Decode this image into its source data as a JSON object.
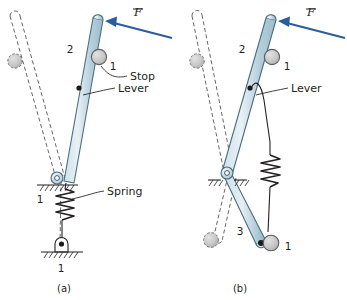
{
  "figure": {
    "type": "mechanism-kinematic-diagram",
    "colors": {
      "link_fill": "#b9d1de",
      "link_fill_light": "#d7e6ee",
      "link_stroke": "#4c6d7d",
      "force_arrow": "#2c5d9b",
      "stop_fill": "#c9c9c9",
      "stop_stroke": "#6b6b6b",
      "line": "#231f20",
      "ghost_dash": "#555555",
      "background": "#ffffff"
    },
    "panels": [
      {
        "id": "a",
        "caption": "(a)",
        "force_label": "F",
        "force_overbar": true,
        "annotations": [
          {
            "name": "stop",
            "label": "Stop"
          },
          {
            "name": "lever",
            "label": "Lever"
          },
          {
            "name": "spring",
            "label": "Spring"
          }
        ],
        "link_numbers": [
          {
            "name": "link-2",
            "label": "2"
          },
          {
            "name": "stop-ground-1",
            "label": "1"
          },
          {
            "name": "pivot-ground-1",
            "label": "1"
          },
          {
            "name": "base-ground-1",
            "label": "1"
          }
        ]
      },
      {
        "id": "b",
        "caption": "(b)",
        "force_label": "F",
        "force_overbar": true,
        "annotations": [
          {
            "name": "lever",
            "label": "Lever"
          }
        ],
        "link_numbers": [
          {
            "name": "link-2",
            "label": "2"
          },
          {
            "name": "stop-ground-1",
            "label": "1"
          },
          {
            "name": "link-3",
            "label": "3"
          },
          {
            "name": "lower-ground-1",
            "label": "1"
          }
        ]
      }
    ]
  }
}
